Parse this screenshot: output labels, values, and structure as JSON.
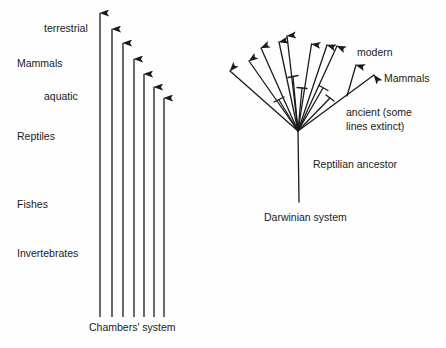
{
  "left_diagram": {
    "caption": "Chambers' system",
    "labels": {
      "terrestrial": "terrestrial",
      "mammals": "Mammals",
      "aquatic": "aquatic",
      "reptiles": "Reptiles",
      "fishes": "Fishes",
      "invertebrates": "Invertebrates"
    },
    "arrows": [
      {
        "x": 100,
        "top": 12
      },
      {
        "x": 112,
        "top": 28
      },
      {
        "x": 123,
        "top": 42
      },
      {
        "x": 134,
        "top": 58
      },
      {
        "x": 144,
        "top": 73
      },
      {
        "x": 154,
        "top": 86
      },
      {
        "x": 164,
        "top": 97
      }
    ],
    "base_y": 317
  },
  "right_diagram": {
    "caption": "Darwinian system",
    "labels": {
      "modern": "modern",
      "mammals": "Mammals",
      "ancient_line1": "ancient (some",
      "ancient_line2": "lines extinct)",
      "ancestor": "Reptilian ancestor"
    },
    "root": {
      "x": 298,
      "y": 131
    },
    "stem_bottom": 202
  },
  "colors": {
    "ink": "#1a1a1a",
    "background": "#fefefe"
  }
}
